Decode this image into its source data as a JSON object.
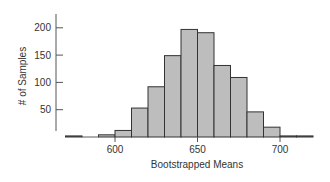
{
  "chart_data": {
    "type": "bar",
    "title": "",
    "xlabel": "Bootstrapped Means",
    "ylabel": "# of Samples",
    "bin_width": 10,
    "bins": [
      {
        "start": 570,
        "end": 580,
        "count": 2
      },
      {
        "start": 580,
        "end": 590,
        "count": 0
      },
      {
        "start": 590,
        "end": 600,
        "count": 4
      },
      {
        "start": 600,
        "end": 610,
        "count": 12
      },
      {
        "start": 610,
        "end": 620,
        "count": 53
      },
      {
        "start": 620,
        "end": 630,
        "count": 92
      },
      {
        "start": 630,
        "end": 640,
        "count": 149
      },
      {
        "start": 640,
        "end": 650,
        "count": 197
      },
      {
        "start": 650,
        "end": 660,
        "count": 191
      },
      {
        "start": 660,
        "end": 670,
        "count": 131
      },
      {
        "start": 670,
        "end": 680,
        "count": 109
      },
      {
        "start": 680,
        "end": 690,
        "count": 46
      },
      {
        "start": 690,
        "end": 700,
        "count": 18
      },
      {
        "start": 700,
        "end": 710,
        "count": 2
      },
      {
        "start": 710,
        "end": 720,
        "count": 2
      }
    ],
    "categories": [
      "570",
      "580",
      "590",
      "600",
      "610",
      "620",
      "630",
      "640",
      "650",
      "660",
      "670",
      "680",
      "690",
      "700",
      "710"
    ],
    "values": [
      2,
      0,
      4,
      12,
      53,
      92,
      149,
      197,
      191,
      131,
      109,
      46,
      18,
      2,
      2
    ],
    "xticks": [
      600,
      650,
      700
    ],
    "yticks": [
      50,
      100,
      150,
      200
    ],
    "xlim": [
      570,
      720
    ],
    "ylim": [
      0,
      220
    ],
    "grid": false,
    "legend": null,
    "colors": {
      "bar_fill": "#bdbdbd",
      "bar_edge": "#333333",
      "axis": "#555555"
    }
  }
}
